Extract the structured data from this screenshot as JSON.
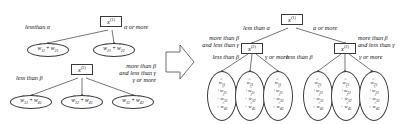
{
  "figure": {
    "kind": "decision-tree-transformation",
    "arrow": "right-block-arrow",
    "stroke_color": "#3a3a3a",
    "text_color": "#111111",
    "background": "#ffffff"
  },
  "left_diagram": {
    "tree1": {
      "root": {
        "var": "x",
        "sup": "(1)"
      },
      "edges": [
        {
          "label": "lessthan α"
        },
        {
          "label": "α or more"
        }
      ],
      "leaves": [
        {
          "terms": [
            "w11",
            "w21"
          ],
          "text": "ŵ11 + ŵ21"
        },
        {
          "terms": [
            "w21",
            "w22"
          ],
          "text": "ŵ21 + ŵ22"
        }
      ]
    },
    "tree2": {
      "root": {
        "var": "x",
        "sup": "(2)"
      },
      "edges": [
        {
          "label": "less than β"
        },
        {
          "label_line1": "more than β",
          "label_line2": "and less than γ"
        },
        {
          "label": "γ or more"
        }
      ],
      "leaves": [
        {
          "terms": [
            "w31",
            "w41"
          ],
          "text": "ŵ31 + ŵ41"
        },
        {
          "terms": [
            "w32",
            "w41"
          ],
          "text": "ŵ32 + ŵ41"
        },
        {
          "terms": [
            "w32",
            "w42"
          ],
          "text": "ŵ32 + ŵ42"
        }
      ]
    }
  },
  "right_diagram": {
    "root": {
      "var": "x",
      "sup": "(1)"
    },
    "root_edges": [
      {
        "label": "less than α"
      },
      {
        "label": "α or more"
      }
    ],
    "level2": [
      {
        "var": "x",
        "sup": "(2)"
      },
      {
        "var": "x",
        "sup": "(2)"
      }
    ],
    "left_subtree_edges": [
      {
        "label": "less than β"
      },
      {
        "label_line1": "more than β",
        "label_line2": "and less than γ"
      },
      {
        "label": "γ or more"
      }
    ],
    "right_subtree_edges": [
      {
        "label": "less than β"
      },
      {
        "label_line1": "more than β",
        "label_line2": "and less than γ"
      },
      {
        "label": "γ or more"
      }
    ],
    "leaves": [
      {
        "terms": [
          "w11",
          "w21",
          "w31",
          "w41"
        ]
      },
      {
        "terms": [
          "w11",
          "w21",
          "w32",
          "w41"
        ]
      },
      {
        "terms": [
          "w11",
          "w21",
          "w32",
          "w42"
        ]
      },
      {
        "terms": [
          "w21",
          "w22",
          "w31",
          "w41"
        ]
      },
      {
        "terms": [
          "w21",
          "w22",
          "w32",
          "w41"
        ]
      },
      {
        "terms": [
          "w21",
          "w22",
          "w32",
          "w42"
        ]
      }
    ]
  },
  "symbols": {
    "w": "w",
    "hat": "̂",
    "plus": "+",
    "alpha": "α",
    "beta": "β",
    "gamma": "γ"
  }
}
